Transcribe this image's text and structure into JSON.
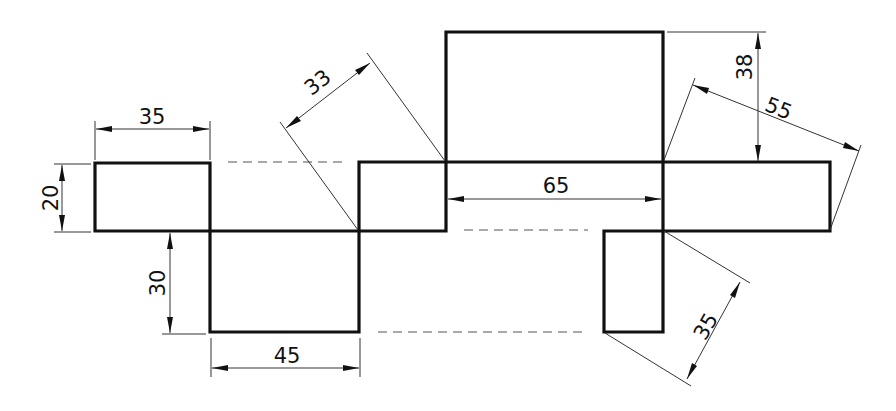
{
  "figure": {
    "type": "technical-drawing",
    "line_color": "#111111"
  },
  "dimensions": {
    "top_left_width": "35",
    "left_height": "20",
    "lower_depth": "30",
    "lower_width": "45",
    "diagonal_upper_left": "33",
    "middle_width": "65",
    "top_height": "38",
    "diagonal_right": "55",
    "diagonal_lower_right": "35"
  }
}
